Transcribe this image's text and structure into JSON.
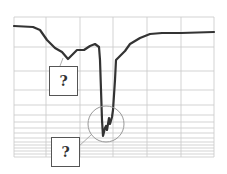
{
  "chart_data": {
    "type": "line",
    "title": "",
    "xlabel": "",
    "ylabel": "",
    "grid": true,
    "x_grid_lines": 6,
    "y_grid": "logarithmic-style spacing (denser toward bottom)",
    "series": [
      {
        "name": "spectrum-curve",
        "description": "Flat baseline with a shallow shoulder dip on the left, a deep narrow absorption dip in the center with jagged noise at the bottom, then recovery to a flat plateau on the right",
        "points": [
          [
            14,
            26
          ],
          [
            33,
            27
          ],
          [
            40,
            30
          ],
          [
            47,
            40
          ],
          [
            55,
            48
          ],
          [
            62,
            52
          ],
          [
            68,
            59
          ],
          [
            72,
            55
          ],
          [
            77,
            50
          ],
          [
            84,
            50
          ],
          [
            90,
            46
          ],
          [
            95,
            44
          ],
          [
            99,
            47
          ],
          [
            100,
            60
          ],
          [
            101,
            90
          ],
          [
            102,
            120
          ],
          [
            103,
            136
          ],
          [
            105,
            128
          ],
          [
            106,
            126
          ],
          [
            107,
            130
          ],
          [
            109,
            118
          ],
          [
            110,
            124
          ],
          [
            112,
            117
          ],
          [
            113,
            110
          ],
          [
            115,
            80
          ],
          [
            116,
            60
          ],
          [
            118,
            58
          ],
          [
            121,
            55
          ],
          [
            125,
            51
          ],
          [
            130,
            44
          ],
          [
            140,
            38
          ],
          [
            150,
            34
          ],
          [
            162,
            33
          ],
          [
            181,
            33
          ],
          [
            214,
            32
          ]
        ]
      }
    ],
    "annotations": [
      {
        "type": "question-box",
        "label": "?",
        "points_to": "left shoulder dip"
      },
      {
        "type": "question-box",
        "label": "?",
        "points_to": "circled noise at bottom of main dip"
      }
    ]
  },
  "grid": {
    "x": [
      14,
      46,
      80,
      113,
      147,
      181,
      214
    ],
    "y": [
      17,
      47,
      71,
      90,
      105,
      115,
      122,
      128,
      133,
      138,
      142,
      145,
      148,
      151,
      154,
      157
    ],
    "color": "#c8c8c8",
    "curve_color": "#333333",
    "circle_color": "#999999"
  },
  "labels": {
    "upper_box": "?",
    "lower_box": "?"
  }
}
